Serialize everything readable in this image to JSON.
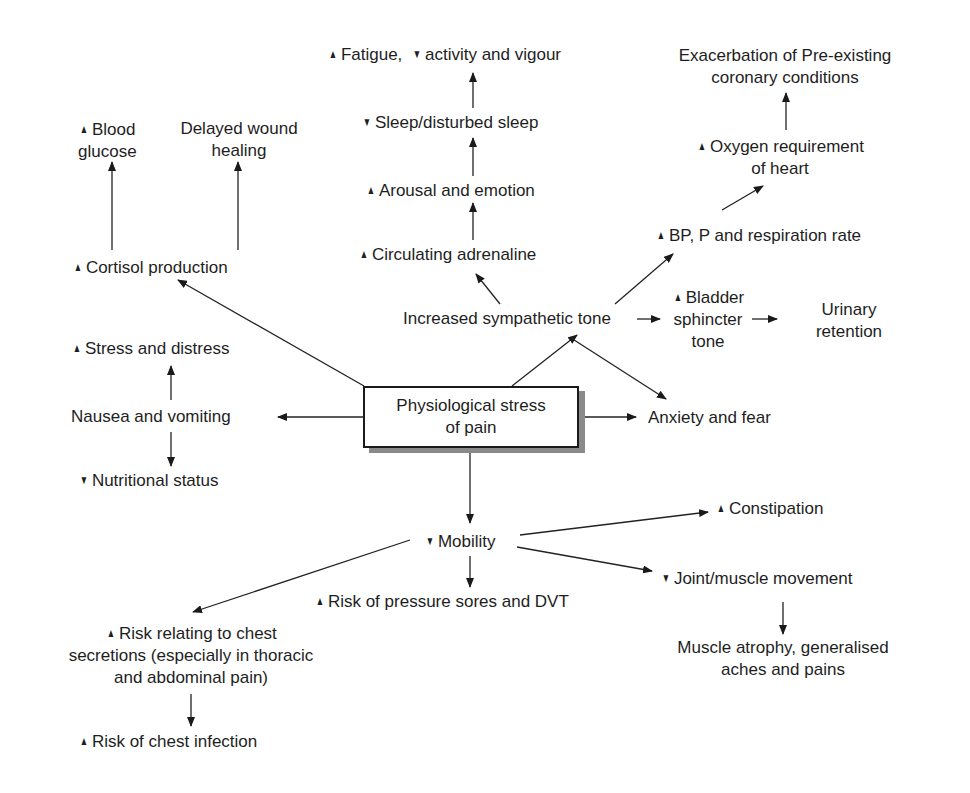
{
  "diagram": {
    "type": "flow-diagram",
    "center": {
      "lines": [
        "Physiological stress",
        "of pain"
      ]
    },
    "nodes": {
      "blood_glucose": {
        "arrow": "up",
        "lines": [
          "Blood",
          "glucose"
        ]
      },
      "delayed_wound": {
        "arrow": "",
        "lines": [
          "Delayed wound",
          "healing"
        ]
      },
      "cortisol": {
        "arrow": "up",
        "lines": [
          "Cortisol production"
        ]
      },
      "fatigue": {
        "arrow": "up",
        "text1": "Fatigue,",
        "arrow2": "down",
        "text2": "activity and vigour"
      },
      "sleep": {
        "arrow": "down",
        "lines": [
          "Sleep/disturbed sleep"
        ]
      },
      "arousal": {
        "arrow": "up",
        "lines": [
          "Arousal and emotion"
        ]
      },
      "adrenaline": {
        "arrow": "up",
        "lines": [
          "Circulating adrenaline"
        ]
      },
      "exacerbation": {
        "arrow": "",
        "lines": [
          "Exacerbation of Pre-existing",
          "coronary conditions"
        ]
      },
      "oxygen": {
        "arrow": "up",
        "lines": [
          "Oxygen requirement",
          "of heart"
        ]
      },
      "bp": {
        "arrow": "up",
        "lines": [
          "BP, P and respiration rate"
        ]
      },
      "sympathetic": {
        "arrow": "",
        "lines": [
          "Increased sympathetic tone"
        ]
      },
      "bladder": {
        "arrow": "up",
        "lines": [
          "Bladder",
          "sphincter",
          "tone"
        ]
      },
      "urinary": {
        "arrow": "",
        "lines": [
          "Urinary",
          "retention"
        ]
      },
      "stress": {
        "arrow": "up",
        "lines": [
          "Stress and distress"
        ]
      },
      "nausea": {
        "arrow": "",
        "lines": [
          "Nausea and vomiting"
        ]
      },
      "nutrition": {
        "arrow": "down",
        "lines": [
          "Nutritional status"
        ]
      },
      "anxiety": {
        "arrow": "",
        "lines": [
          "Anxiety and fear"
        ]
      },
      "mobility": {
        "arrow": "down",
        "lines": [
          "Mobility"
        ]
      },
      "constipation": {
        "arrow": "up",
        "lines": [
          "Constipation"
        ]
      },
      "joint": {
        "arrow": "down",
        "lines": [
          "Joint/muscle movement"
        ]
      },
      "pressure_sores": {
        "arrow": "up",
        "lines": [
          "Risk of pressure sores and DVT"
        ]
      },
      "muscle_atrophy": {
        "arrow": "",
        "lines": [
          "Muscle atrophy, generalised",
          "aches and pains"
        ]
      },
      "chest_secretions": {
        "arrow": "up",
        "lines": [
          "Risk relating to chest",
          "secretions (especially in thoracic",
          "and abdominal pain)"
        ]
      },
      "chest_infection": {
        "arrow": "up",
        "lines": [
          "Risk of chest infection"
        ]
      }
    },
    "symbols": {
      "up": "▲",
      "down": "▼"
    },
    "edges": [
      [
        "center",
        "cortisol"
      ],
      [
        "cortisol",
        "blood_glucose"
      ],
      [
        "cortisol",
        "delayed_wound"
      ],
      [
        "center",
        "sympathetic"
      ],
      [
        "sympathetic",
        "adrenaline"
      ],
      [
        "adrenaline",
        "arousal"
      ],
      [
        "arousal",
        "sleep"
      ],
      [
        "sleep",
        "fatigue"
      ],
      [
        "sympathetic",
        "bp"
      ],
      [
        "bp",
        "oxygen"
      ],
      [
        "oxygen",
        "exacerbation"
      ],
      [
        "sympathetic",
        "bladder"
      ],
      [
        "bladder",
        "urinary"
      ],
      [
        "sympathetic",
        "anxiety"
      ],
      [
        "center",
        "anxiety"
      ],
      [
        "center",
        "nausea"
      ],
      [
        "nausea",
        "stress"
      ],
      [
        "nausea",
        "nutrition"
      ],
      [
        "center",
        "mobility"
      ],
      [
        "mobility",
        "constipation"
      ],
      [
        "mobility",
        "joint"
      ],
      [
        "mobility",
        "pressure_sores"
      ],
      [
        "mobility",
        "chest_secretions"
      ],
      [
        "joint",
        "muscle_atrophy"
      ],
      [
        "chest_secretions",
        "chest_infection"
      ]
    ]
  }
}
